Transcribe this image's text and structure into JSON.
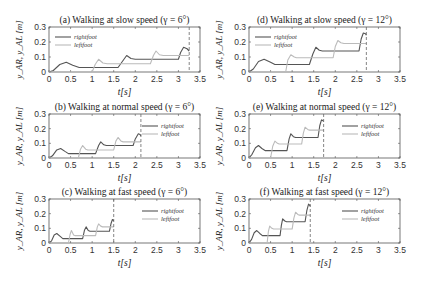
{
  "figure": {
    "ylabel": "y_AR, y_AL [m]",
    "xlabel": "t[s]",
    "legend": [
      "rightfoot",
      "leftfoot"
    ]
  },
  "colors": {
    "rightfoot": "#555555",
    "leftfoot": "#bbbbbb",
    "axis": "#555555",
    "vline": "#666666"
  },
  "chart_data": [
    {
      "id": "a",
      "type": "line",
      "title": "(a) Walking at slow speed (γ = 6°)",
      "xlabel": "t[s]",
      "ylabel": "y_AR, y_AL [m]",
      "xlim": [
        0,
        3.5
      ],
      "ylim": [
        0,
        0.3
      ],
      "xticks": [
        "0",
        "0.5",
        "1",
        "1.5",
        "2",
        "2.5",
        "3",
        "3.5"
      ],
      "yticks": [
        "0",
        "0.1",
        "0.2",
        "0.3"
      ],
      "legend_position": "upper left",
      "end_time": 3.25,
      "series": [
        {
          "name": "rightfoot",
          "points": [
            [
              0,
              0
            ],
            [
              0.1,
              0.01
            ],
            [
              0.25,
              0.05
            ],
            [
              0.4,
              0.065
            ],
            [
              0.55,
              0.045
            ],
            [
              0.7,
              0.03
            ],
            [
              1.6,
              0.03
            ],
            [
              1.7,
              0.07
            ],
            [
              1.8,
              0.11
            ],
            [
              1.9,
              0.09
            ],
            [
              2.0,
              0.085
            ],
            [
              3.0,
              0.085
            ],
            [
              3.05,
              0.13
            ],
            [
              3.12,
              0.165
            ],
            [
              3.2,
              0.155
            ],
            [
              3.25,
              0.14
            ]
          ]
        },
        {
          "name": "leftfoot",
          "points": [
            [
              0,
              0
            ],
            [
              1.0,
              0
            ],
            [
              1.07,
              0.05
            ],
            [
              1.15,
              0.085
            ],
            [
              1.25,
              0.06
            ],
            [
              1.35,
              0.055
            ],
            [
              2.35,
              0.055
            ],
            [
              2.42,
              0.11
            ],
            [
              2.48,
              0.14
            ],
            [
              2.56,
              0.115
            ],
            [
              2.65,
              0.11
            ],
            [
              3.25,
              0.11
            ]
          ]
        }
      ]
    },
    {
      "id": "d",
      "type": "line",
      "title": "(d) Walking at slow speed (γ = 12°)",
      "xlabel": "t[s]",
      "ylabel": "y_AR, y_AL [m]",
      "xlim": [
        0,
        3.5
      ],
      "ylim": [
        0,
        0.3
      ],
      "xticks": [
        "0",
        "0.5",
        "1",
        "1.5",
        "2",
        "2.5",
        "3",
        "3.5"
      ],
      "yticks": [
        "0",
        "0.1",
        "0.2",
        "0.3"
      ],
      "legend_position": "upper left",
      "end_time": 2.72,
      "series": [
        {
          "name": "rightfoot",
          "points": [
            [
              0,
              0
            ],
            [
              0.1,
              0.02
            ],
            [
              0.22,
              0.07
            ],
            [
              0.35,
              0.085
            ],
            [
              0.5,
              0.065
            ],
            [
              0.6,
              0.05
            ],
            [
              1.4,
              0.05
            ],
            [
              1.48,
              0.12
            ],
            [
              1.55,
              0.165
            ],
            [
              1.63,
              0.145
            ],
            [
              1.7,
              0.14
            ],
            [
              2.55,
              0.14
            ],
            [
              2.6,
              0.22
            ],
            [
              2.65,
              0.26
            ],
            [
              2.7,
              0.255
            ],
            [
              2.72,
              0.245
            ]
          ]
        },
        {
          "name": "leftfoot",
          "points": [
            [
              0,
              0
            ],
            [
              0.85,
              0
            ],
            [
              0.9,
              0.08
            ],
            [
              0.97,
              0.115
            ],
            [
              1.05,
              0.1
            ],
            [
              1.1,
              0.095
            ],
            [
              1.95,
              0.095
            ],
            [
              2.0,
              0.17
            ],
            [
              2.06,
              0.21
            ],
            [
              2.13,
              0.195
            ],
            [
              2.2,
              0.19
            ],
            [
              2.72,
              0.19
            ]
          ]
        }
      ]
    },
    {
      "id": "b",
      "type": "line",
      "title": "(b) Walking at normal speed (γ = 6°)",
      "xlabel": "t[s]",
      "ylabel": "y_AR, y_AL [m]",
      "xlim": [
        0,
        3.5
      ],
      "ylim": [
        0,
        0.3
      ],
      "xticks": [
        "0",
        "0.5",
        "1",
        "1.5",
        "2",
        "2.5",
        "3",
        "3.5"
      ],
      "yticks": [
        "0",
        "0.1",
        "0.2",
        "0.3"
      ],
      "legend_position": "upper right",
      "end_time": 2.13,
      "series": [
        {
          "name": "rightfoot",
          "points": [
            [
              0,
              0
            ],
            [
              0.08,
              0.015
            ],
            [
              0.18,
              0.055
            ],
            [
              0.27,
              0.065
            ],
            [
              0.37,
              0.045
            ],
            [
              0.45,
              0.03
            ],
            [
              1.08,
              0.03
            ],
            [
              1.15,
              0.085
            ],
            [
              1.2,
              0.11
            ],
            [
              1.27,
              0.09
            ],
            [
              1.33,
              0.085
            ],
            [
              1.95,
              0.085
            ],
            [
              2.0,
              0.13
            ],
            [
              2.07,
              0.165
            ],
            [
              2.11,
              0.16
            ],
            [
              2.13,
              0.15
            ]
          ]
        },
        {
          "name": "leftfoot",
          "points": [
            [
              0,
              0
            ],
            [
              0.68,
              0
            ],
            [
              0.73,
              0.06
            ],
            [
              0.78,
              0.085
            ],
            [
              0.85,
              0.06
            ],
            [
              0.9,
              0.055
            ],
            [
              1.5,
              0.055
            ],
            [
              1.55,
              0.115
            ],
            [
              1.6,
              0.14
            ],
            [
              1.67,
              0.115
            ],
            [
              1.72,
              0.11
            ],
            [
              2.13,
              0.11
            ]
          ]
        }
      ]
    },
    {
      "id": "e",
      "type": "line",
      "title": "(e) Walking at normal speed (γ = 12°)",
      "xlabel": "t[s]",
      "ylabel": "y_AR, y_AL [m]",
      "xlim": [
        0,
        3.5
      ],
      "ylim": [
        0,
        0.3
      ],
      "xticks": [
        "0",
        "0.5",
        "1",
        "1.5",
        "2",
        "2.5",
        "3",
        "3.5"
      ],
      "yticks": [
        "0",
        "0.1",
        "0.2",
        "0.3"
      ],
      "legend_position": "upper right",
      "end_time": 1.73,
      "series": [
        {
          "name": "rightfoot",
          "points": [
            [
              0,
              0
            ],
            [
              0.07,
              0.025
            ],
            [
              0.15,
              0.07
            ],
            [
              0.22,
              0.085
            ],
            [
              0.3,
              0.065
            ],
            [
              0.38,
              0.05
            ],
            [
              0.88,
              0.05
            ],
            [
              0.93,
              0.13
            ],
            [
              0.97,
              0.165
            ],
            [
              1.03,
              0.145
            ],
            [
              1.08,
              0.14
            ],
            [
              1.6,
              0.14
            ],
            [
              1.64,
              0.22
            ],
            [
              1.68,
              0.26
            ],
            [
              1.71,
              0.255
            ],
            [
              1.73,
              0.25
            ]
          ]
        },
        {
          "name": "leftfoot",
          "points": [
            [
              0,
              0
            ],
            [
              0.5,
              0
            ],
            [
              0.55,
              0.08
            ],
            [
              0.6,
              0.115
            ],
            [
              0.66,
              0.1
            ],
            [
              0.7,
              0.095
            ],
            [
              1.22,
              0.095
            ],
            [
              1.26,
              0.17
            ],
            [
              1.3,
              0.21
            ],
            [
              1.36,
              0.195
            ],
            [
              1.4,
              0.19
            ],
            [
              1.73,
              0.19
            ]
          ]
        }
      ]
    },
    {
      "id": "c",
      "type": "line",
      "title": "(c) Walking at fast speed  (γ = 6°)",
      "xlabel": "t[s]",
      "ylabel": "y_AR, y_AL [m]",
      "xlim": [
        0,
        3.5
      ],
      "ylim": [
        0,
        0.3
      ],
      "xticks": [
        "0",
        "0.5",
        "1",
        "1.5",
        "2",
        "2.5",
        "3",
        "3.5"
      ],
      "yticks": [
        "0",
        "0.1",
        "0.2",
        "0.3"
      ],
      "legend_position": "upper right",
      "end_time": 1.5,
      "series": [
        {
          "name": "rightfoot",
          "points": [
            [
              0,
              0
            ],
            [
              0.06,
              0.015
            ],
            [
              0.12,
              0.055
            ],
            [
              0.18,
              0.065
            ],
            [
              0.26,
              0.045
            ],
            [
              0.32,
              0.03
            ],
            [
              0.78,
              0.03
            ],
            [
              0.82,
              0.085
            ],
            [
              0.86,
              0.11
            ],
            [
              0.91,
              0.085
            ],
            [
              0.95,
              0.08
            ],
            [
              1.4,
              0.08
            ],
            [
              1.44,
              0.135
            ],
            [
              1.47,
              0.16
            ],
            [
              1.49,
              0.155
            ],
            [
              1.5,
              0.15
            ]
          ]
        },
        {
          "name": "leftfoot",
          "points": [
            [
              0,
              0
            ],
            [
              0.45,
              0
            ],
            [
              0.49,
              0.06
            ],
            [
              0.52,
              0.085
            ],
            [
              0.57,
              0.055
            ],
            [
              0.61,
              0.05
            ],
            [
              1.08,
              0.05
            ],
            [
              1.12,
              0.11
            ],
            [
              1.15,
              0.13
            ],
            [
              1.2,
              0.115
            ],
            [
              1.24,
              0.11
            ],
            [
              1.5,
              0.11
            ]
          ]
        }
      ]
    },
    {
      "id": "f",
      "type": "line",
      "title": "(f) Walking at fast speed (γ = 12°)",
      "xlabel": "t[s]",
      "ylabel": "y_AR, y_AL [m]",
      "xlim": [
        0,
        3.5
      ],
      "ylim": [
        0,
        0.3
      ],
      "xticks": [
        "0",
        "0.5",
        "1",
        "1.5",
        "2",
        "2.5",
        "3",
        "3.5"
      ],
      "yticks": [
        "0",
        "0.1",
        "0.2",
        "0.3"
      ],
      "legend_position": "upper right",
      "end_time": 1.42,
      "series": [
        {
          "name": "rightfoot",
          "points": [
            [
              0,
              0
            ],
            [
              0.06,
              0.025
            ],
            [
              0.12,
              0.07
            ],
            [
              0.18,
              0.085
            ],
            [
              0.25,
              0.065
            ],
            [
              0.31,
              0.05
            ],
            [
              0.72,
              0.05
            ],
            [
              0.75,
              0.12
            ],
            [
              0.78,
              0.165
            ],
            [
              0.83,
              0.15
            ],
            [
              0.87,
              0.145
            ],
            [
              1.3,
              0.145
            ],
            [
              1.34,
              0.22
            ],
            [
              1.38,
              0.265
            ],
            [
              1.4,
              0.26
            ],
            [
              1.42,
              0.25
            ]
          ]
        },
        {
          "name": "leftfoot",
          "points": [
            [
              0,
              0
            ],
            [
              0.42,
              0
            ],
            [
              0.45,
              0.08
            ],
            [
              0.48,
              0.115
            ],
            [
              0.53,
              0.1
            ],
            [
              0.57,
              0.095
            ],
            [
              1.0,
              0.095
            ],
            [
              1.04,
              0.17
            ],
            [
              1.08,
              0.21
            ],
            [
              1.13,
              0.195
            ],
            [
              1.17,
              0.19
            ],
            [
              1.42,
              0.19
            ]
          ]
        }
      ]
    }
  ]
}
